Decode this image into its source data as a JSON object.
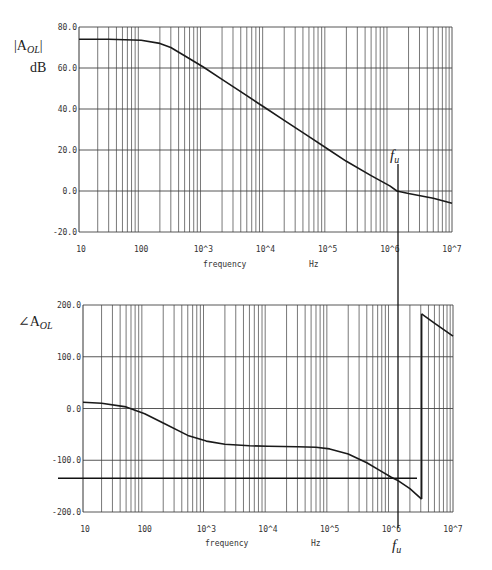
{
  "chart_data": [
    {
      "type": "line",
      "title": "",
      "ylabel": "|A_OL| dB",
      "ylabel_main": "|A",
      "ylabel_sub": "OL",
      "ylabel_unit": "dB",
      "xlabel": "frequency",
      "xunit": "Hz",
      "xscale": "log",
      "xlim": [
        10,
        10000000
      ],
      "ylim": [
        -20,
        80
      ],
      "yticks": [
        80,
        60,
        40,
        20,
        0,
        -20
      ],
      "ytick_labels": [
        "80.0",
        "60.0",
        "40.0",
        "20.0",
        "0.0",
        "-20.0"
      ],
      "xticks": [
        10,
        100,
        1000,
        10000,
        100000,
        1000000,
        10000000
      ],
      "xtick_labels": [
        "10",
        "100",
        "10^3",
        "10^4",
        "10^5",
        "10^6",
        "10^7"
      ],
      "grid": true,
      "series": [
        {
          "name": "magnitude",
          "x": [
            10,
            30,
            100,
            200,
            300,
            500,
            1000,
            2000,
            5000,
            10000,
            20000,
            50000,
            100000,
            200000,
            500000,
            1000000,
            1300000,
            2000000,
            5000000,
            10000000
          ],
          "values": [
            74,
            74,
            73.5,
            72,
            70,
            66,
            60.5,
            54.5,
            46.5,
            40.5,
            34.5,
            26.5,
            20.5,
            14.5,
            7.5,
            2.5,
            0,
            -1.2,
            -3.5,
            -6
          ]
        }
      ],
      "annotations": [
        {
          "label": "f_u",
          "x": 1300000,
          "description": "unity-gain frequency marker (vertical line at 0 dB crossing)"
        }
      ]
    },
    {
      "type": "line",
      "title": "",
      "ylabel": "∠A_OL",
      "ylabel_main": "∠A",
      "ylabel_sub": "OL",
      "xlabel": "frequency",
      "xunit": "Hz",
      "xscale": "log",
      "xlim": [
        10,
        10000000
      ],
      "ylim": [
        -200,
        200
      ],
      "yticks": [
        200,
        100,
        0,
        -100,
        -200
      ],
      "ytick_labels": [
        "200.0",
        "100.0",
        "0.0",
        "-100.0",
        "-200.0"
      ],
      "xticks": [
        10,
        100,
        1000,
        10000,
        100000,
        1000000,
        10000000
      ],
      "xtick_labels": [
        "10",
        "100",
        "10^3",
        "10^4",
        "10^5",
        "10^6",
        "10^7"
      ],
      "grid": true,
      "series": [
        {
          "name": "phase",
          "x": [
            10,
            20,
            50,
            100,
            200,
            500,
            1000,
            2000,
            5000,
            10000,
            30000,
            60000,
            100000,
            200000,
            400000,
            700000,
            1000000,
            1300000,
            2000000,
            3100000,
            3100001,
            5000000,
            10000000
          ],
          "values": [
            12,
            10,
            3,
            -10,
            -28,
            -52,
            -63,
            -69,
            -72,
            -73,
            -74,
            -75,
            -78,
            -88,
            -105,
            -122,
            -133,
            -140,
            -155,
            -175,
            183,
            165,
            140
          ]
        }
      ],
      "annotations": [
        {
          "label": "f_u",
          "x": 1300000,
          "description": "unity-gain frequency marker"
        },
        {
          "label": "",
          "y": -135,
          "description": "horizontal reference line at -135 degrees"
        }
      ]
    }
  ],
  "labels": {
    "mag_y_main": "|A",
    "mag_y_sub": "OL",
    "mag_y_close": "|",
    "mag_y_unit": "dB",
    "phase_y_main": "∠A",
    "phase_y_sub": "OL",
    "fu_main": "f",
    "fu_sub": "u",
    "xlabel": "frequency",
    "xunit": "Hz"
  },
  "layout": {
    "mag": {
      "x0": 79,
      "x1": 452,
      "y0": 27,
      "y1": 232
    },
    "phase": {
      "x0": 83,
      "x1": 453,
      "y0": 305,
      "y1": 512
    },
    "fu_x": 398,
    "ref_line": {
      "x_start": 58,
      "x_end": 417,
      "value": -135
    }
  }
}
